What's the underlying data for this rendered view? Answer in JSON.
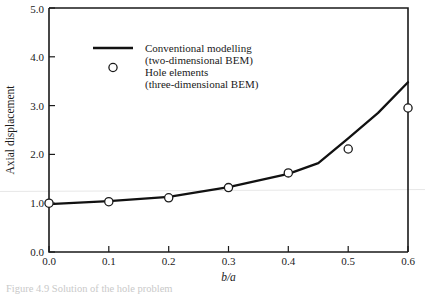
{
  "chart_data": {
    "type": "line",
    "title": "",
    "xlabel": "b/a",
    "ylabel": "Axial displacement",
    "xlim": [
      0.0,
      0.6
    ],
    "ylim": [
      0.0,
      5.0
    ],
    "grid": false,
    "legend_position": "upper-left-inside",
    "x_ticks": [
      "0.0",
      "0.1",
      "0.2",
      "0.3",
      "0.4",
      "0.5",
      "0.6"
    ],
    "x_tick_values": [
      0.0,
      0.1,
      0.2,
      0.3,
      0.4,
      0.5,
      0.6
    ],
    "y_ticks": [
      "0.0",
      "1.0",
      "2.0",
      "3.0",
      "4.0",
      "5.0"
    ],
    "y_tick_values": [
      0.0,
      1.0,
      2.0,
      3.0,
      4.0,
      5.0
    ],
    "series": [
      {
        "name": "Conventional modelling (two-dimensional BEM)",
        "style": "line",
        "x": [
          0.0,
          0.1,
          0.2,
          0.3,
          0.4,
          0.45,
          0.5,
          0.55,
          0.6
        ],
        "values": [
          0.98,
          1.04,
          1.13,
          1.33,
          1.6,
          1.82,
          2.33,
          2.85,
          3.48
        ]
      },
      {
        "name": "Hole elements (three-dimensional BEM)",
        "style": "marker",
        "x": [
          0.0,
          0.1,
          0.2,
          0.3,
          0.4,
          0.5,
          0.6
        ],
        "values": [
          1.0,
          1.03,
          1.11,
          1.32,
          1.62,
          2.11,
          2.95
        ]
      }
    ]
  },
  "legend": {
    "entries": [
      {
        "marker": "line",
        "label_line1": "Conventional modelling",
        "label_line2": "(two-dimensional BEM)"
      },
      {
        "marker": "circle",
        "label_line1": "Hole elements",
        "label_line2": "(three-dimensional BEM)"
      }
    ]
  },
  "axes": {
    "y_title": "Axial displacement",
    "x_title": "b/a",
    "x_tick_labels": [
      "0.0",
      "0.1",
      "0.2",
      "0.3",
      "0.4",
      "0.5",
      "0.6"
    ],
    "y_tick_labels": [
      "0.0",
      "1.0",
      "2.0",
      "3.0",
      "4.0",
      "5.0"
    ]
  },
  "caption": {
    "text": "Figure 4.9  Solution of the hole problem"
  },
  "colors": {
    "line": "#111111",
    "axis": "#1a1a1a",
    "marker_fill": "#ffffff",
    "background": "#ffffff"
  }
}
